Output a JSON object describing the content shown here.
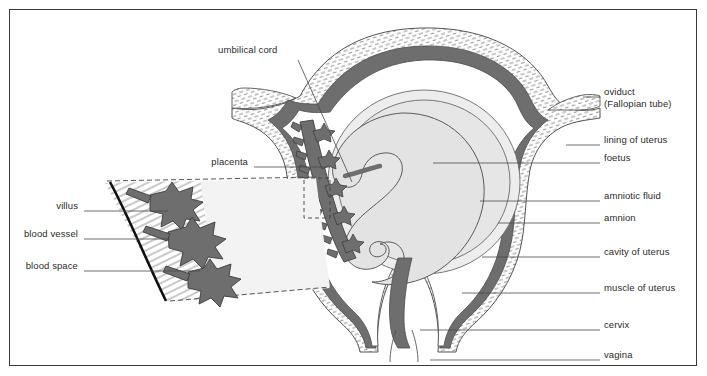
{
  "figure": {
    "border_color": "#3a3a3a",
    "background": "#ffffff",
    "colors": {
      "dark_gray": "#6e6e6e",
      "mid_gray": "#8c8c8c",
      "light_fill": "#eaeaea",
      "pale_fill": "#f2f2f2",
      "outline": "#555555",
      "leader_line": "#4a4a4a",
      "thick_arc": "#111111"
    }
  },
  "labels_right": [
    {
      "id": "oviduct",
      "line1": "oviduct",
      "line2": "(Fallopian tube)",
      "text_x": 604,
      "text_y": 92,
      "leader_x1": 583,
      "leader_x2": 600,
      "leader_y": 97
    },
    {
      "id": "lining-of-uterus",
      "line1": "lining of uterus",
      "line2": "",
      "text_x": 604,
      "text_y": 140,
      "leader_x1": 566,
      "leader_x2": 600,
      "leader_y": 145
    },
    {
      "id": "foetus",
      "line1": "foetus",
      "line2": "",
      "text_x": 604,
      "text_y": 158,
      "leader_x1": 433,
      "leader_x2": 600,
      "leader_y": 163
    },
    {
      "id": "amniotic-fluid",
      "line1": "amniotic fluid",
      "line2": "",
      "text_x": 604,
      "text_y": 196,
      "leader_x1": 480,
      "leader_x2": 600,
      "leader_y": 201
    },
    {
      "id": "amnion",
      "line1": "amnion",
      "line2": "",
      "text_x": 604,
      "text_y": 218,
      "leader_x1": 498,
      "leader_x2": 600,
      "leader_y": 223
    },
    {
      "id": "cavity-of-uterus",
      "line1": "cavity of uterus",
      "line2": "",
      "text_x": 604,
      "text_y": 252,
      "leader_x1": 482,
      "leader_x2": 600,
      "leader_y": 257
    },
    {
      "id": "muscle-of-uterus",
      "line1": "muscle of uterus",
      "line2": "",
      "text_x": 604,
      "text_y": 288,
      "leader_x1": 462,
      "leader_x2": 600,
      "leader_y": 293
    },
    {
      "id": "cervix",
      "line1": "cervix",
      "line2": "",
      "text_x": 604,
      "text_y": 325,
      "leader_x1": 420,
      "leader_x2": 600,
      "leader_y": 330
    },
    {
      "id": "vagina",
      "line1": "vagina",
      "line2": "",
      "text_x": 604,
      "text_y": 355,
      "leader_x1": 430,
      "leader_x2": 600,
      "leader_y": 360
    }
  ],
  "labels_left": [
    {
      "id": "villus",
      "text": "villus",
      "text_right": 78,
      "text_y": 206,
      "leader_x1": 84,
      "leader_x2": 168,
      "leader_y": 211
    },
    {
      "id": "blood-vessel",
      "text": "blood vessel",
      "text_right": 78,
      "text_y": 234,
      "leader_x1": 84,
      "leader_x2": 170,
      "leader_y": 239
    },
    {
      "id": "blood-space",
      "text": "blood space",
      "text_right": 78,
      "text_y": 266,
      "leader_x1": 84,
      "leader_x2": 200,
      "leader_y": 271
    }
  ],
  "labels_other": [
    {
      "id": "umbilical-cord",
      "text": "umbilical cord",
      "text_x": 218,
      "text_y": 50,
      "leader_x1": 298,
      "leader_y1": 60,
      "leader_x2": 352,
      "leader_y2": 182
    },
    {
      "id": "placenta",
      "text": "placenta",
      "text_right": 248,
      "text_y": 162,
      "leader_x1": 254,
      "leader_x2": 330,
      "leader_y": 167
    }
  ],
  "structures": [
    {
      "name": "uterus-muscle-wall",
      "fill": "hatched",
      "description": "thick hatched muscular wall of uterus"
    },
    {
      "name": "uterus-lining",
      "fill": "#6e6e6e",
      "description": "dark grey endometrial lining"
    },
    {
      "name": "uterus-cavity",
      "fill": "#ffffff",
      "description": "white cavity of uterus"
    },
    {
      "name": "amnion-membrane",
      "fill": "none",
      "description": "thin membrane enclosing amniotic fluid"
    },
    {
      "name": "amniotic-fluid",
      "fill": "#eeeeee",
      "description": "pale fluid surrounding foetus"
    },
    {
      "name": "foetus",
      "fill": "#e8e8e8",
      "description": "curled foetus outline"
    },
    {
      "name": "placenta",
      "fill": "#6e6e6e",
      "description": "dark grey placenta with villi along left uterine wall"
    },
    {
      "name": "umbilical-cord",
      "fill": "#6e6e6e",
      "description": "cord from placenta to foetus"
    },
    {
      "name": "oviduct-left",
      "fill": "hatched",
      "description": "left Fallopian tube"
    },
    {
      "name": "oviduct-right",
      "fill": "hatched",
      "description": "right Fallopian tube"
    },
    {
      "name": "cervix",
      "fill": "#6e6e6e",
      "description": "neck of uterus"
    },
    {
      "name": "vagina",
      "fill": "#ffffff",
      "description": "vaginal canal below cervix"
    },
    {
      "name": "magnified-wedge",
      "fill": "#f2f2f2",
      "description": "enlarged detail wedge of placenta showing villi, blood vessels and blood spaces"
    }
  ]
}
